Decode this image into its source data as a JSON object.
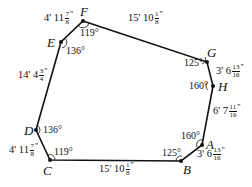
{
  "diagram": {
    "type": "octagon-floorplan",
    "vertices": {
      "A": {
        "label": "A",
        "x": 202,
        "y": 145,
        "angle": "160°"
      },
      "B": {
        "label": "B",
        "x": 181,
        "y": 161,
        "angle": "125°"
      },
      "C": {
        "label": "C",
        "x": 50,
        "y": 160,
        "angle": "119°"
      },
      "D": {
        "label": "D",
        "x": 36,
        "y": 130,
        "angle": "136°"
      },
      "E": {
        "label": "E",
        "x": 61,
        "y": 42,
        "angle": "136°"
      },
      "F": {
        "label": "F",
        "x": 83,
        "y": 21,
        "angle": "119°"
      },
      "G": {
        "label": "G",
        "x": 207,
        "y": 62,
        "angle": "125°"
      },
      "H": {
        "label": "H",
        "x": 213,
        "y": 86,
        "angle": "160°"
      }
    },
    "edges": {
      "FG": {
        "whole": "15' 10",
        "num": "1",
        "den": "8"
      },
      "GH": {
        "whole": "3' 6",
        "num": "13",
        "den": "16"
      },
      "HA": {
        "whole": "6' 7",
        "num": "11",
        "den": "16"
      },
      "AB": {
        "whole": "3' 6",
        "num": "13",
        "den": "16"
      },
      "BC": {
        "whole": "15' 10",
        "num": "1",
        "den": "8"
      },
      "CD": {
        "whole": "4' 11",
        "num": "7",
        "den": "8"
      },
      "DE": {
        "whole": "14' 4",
        "num": "3",
        "den": "4"
      },
      "EF": {
        "whole": "4' 11",
        "num": "7",
        "den": "8"
      }
    },
    "inch_mark": "\"",
    "colors": {
      "line": "#111111",
      "background": "#ffffff"
    }
  }
}
